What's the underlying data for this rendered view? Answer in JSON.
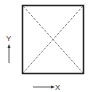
{
  "diagram": {
    "shape": "square",
    "diagonals": "dashed",
    "colors": {
      "stroke": "#222222",
      "diagonal": "#555555",
      "label": "#333333",
      "background": "#ffffff"
    },
    "axes": {
      "y_label": "Y",
      "x_label": "X"
    }
  }
}
